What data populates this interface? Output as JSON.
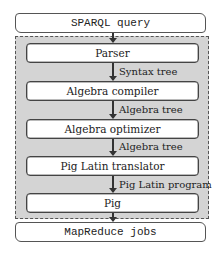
{
  "diagram": {
    "input": "SPARQL query",
    "output": "MapReduce jobs",
    "stages": [
      {
        "label": "Parser"
      },
      {
        "label": "Algebra compiler"
      },
      {
        "label": "Algebra optimizer"
      },
      {
        "label": "Pig Latin translator"
      },
      {
        "label": "Pig"
      }
    ],
    "edges": [
      {
        "label": "Syntax tree"
      },
      {
        "label": "Algebra tree"
      },
      {
        "label": "Algebra tree"
      },
      {
        "label": "Pig Latin program"
      }
    ],
    "colors": {
      "container_fill": "#d4d4d4",
      "box_fill": "#ffffff",
      "stroke": "#444444"
    }
  }
}
